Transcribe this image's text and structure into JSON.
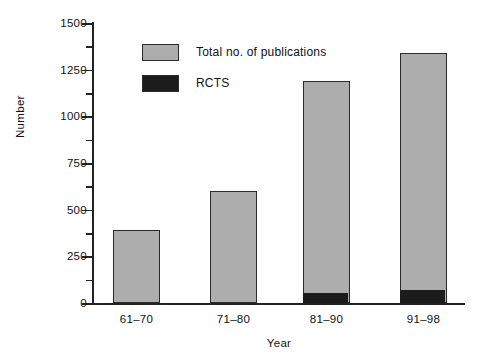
{
  "chart_data": {
    "type": "bar",
    "title": "",
    "xlabel": "Year",
    "ylabel": "Number",
    "categories": [
      "61–70",
      "71–80",
      "81–90",
      "91–98"
    ],
    "series": [
      {
        "name": "Total no. of publications",
        "values": [
          390,
          600,
          1190,
          1340
        ],
        "color": "#adadad"
      },
      {
        "name": "RCTS",
        "values": [
          0,
          0,
          50,
          70
        ],
        "color": "#1c1c1c"
      }
    ],
    "stacked": true,
    "ylim": [
      0,
      1500
    ],
    "ytick_values": [
      0,
      250,
      500,
      750,
      1000,
      1250,
      1500
    ],
    "ytick_labels": [
      "0",
      "250",
      "500",
      "750",
      "1000",
      "1250",
      "1500"
    ],
    "yminor_values": [
      125,
      375,
      625,
      875,
      1125,
      1375
    ],
    "grid": false,
    "legend_position": "upper-left-inside",
    "legend": [
      {
        "label": "Total no. of publications",
        "color": "#adadad"
      },
      {
        "label": "RCTS",
        "color": "#1c1c1c"
      }
    ]
  }
}
